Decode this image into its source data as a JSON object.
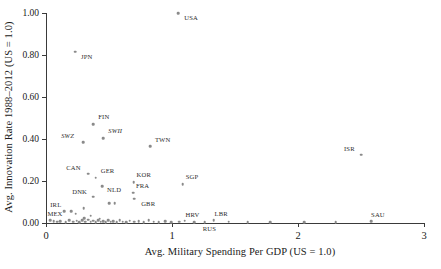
{
  "chart_data": {
    "type": "scatter",
    "title": "",
    "xlabel": "Avg. Military Spending Per GDP (US = 1.0)",
    "ylabel": "Avg. Innovation Rate 1988–2012 (US = 1.0)",
    "xlim": [
      0,
      3
    ],
    "ylim": [
      0.0,
      1.0
    ],
    "xticks": [
      "0",
      "1",
      "2",
      "3"
    ],
    "xtick_values": [
      0,
      1,
      2,
      3
    ],
    "yticks": [
      "0.00",
      "0.20",
      "0.40",
      "0.60",
      "0.80",
      "1.00"
    ],
    "ytick_values": [
      0.0,
      0.2,
      0.4,
      0.6,
      0.8,
      1.0
    ],
    "grid": false,
    "legend": null,
    "marker_color": "#8a8a8a",
    "axis_color": "#3a3a3a",
    "labeled_points": [
      {
        "label": "USA",
        "x": 1.05,
        "y": 1.0,
        "lx": 6,
        "ly": 5,
        "italic": false
      },
      {
        "label": "JPN",
        "x": 0.23,
        "y": 0.815,
        "lx": 6,
        "ly": 5,
        "italic": false
      },
      {
        "label": "FIN",
        "x": 0.375,
        "y": 0.47,
        "lx": 5,
        "ly": -7,
        "italic": false
      },
      {
        "label": "SWII",
        "x": 0.455,
        "y": 0.405,
        "lx": 5,
        "ly": -7,
        "italic": true
      },
      {
        "label": "SWZ",
        "x": 0.295,
        "y": 0.385,
        "lx": -22,
        "ly": -6,
        "italic": true
      },
      {
        "label": "TWN",
        "x": 0.825,
        "y": 0.365,
        "lx": 5,
        "ly": -6,
        "italic": false
      },
      {
        "label": "ISR",
        "x": 2.5,
        "y": 0.325,
        "lx": -17,
        "ly": -6,
        "italic": false
      },
      {
        "label": "CAN",
        "x": 0.335,
        "y": 0.235,
        "lx": -22,
        "ly": -6,
        "italic": false
      },
      {
        "label": "GER",
        "x": 0.395,
        "y": 0.215,
        "lx": 5,
        "ly": -7,
        "italic": false
      },
      {
        "label": "KOR",
        "x": 0.695,
        "y": 0.195,
        "lx": 3,
        "ly": -7,
        "italic": false
      },
      {
        "label": "SGP",
        "x": 1.085,
        "y": 0.185,
        "lx": 3,
        "ly": -7,
        "italic": false
      },
      {
        "label": "NLD",
        "x": 0.445,
        "y": 0.175,
        "lx": 5,
        "ly": 4,
        "italic": false
      },
      {
        "label": "FRA",
        "x": 0.69,
        "y": 0.145,
        "lx": 3,
        "ly": -7,
        "italic": false
      },
      {
        "label": "DNK",
        "x": 0.375,
        "y": 0.125,
        "lx": -21,
        "ly": -5,
        "italic": false
      },
      {
        "label": "GBR",
        "x": 0.7,
        "y": 0.115,
        "lx": 7,
        "ly": 5,
        "italic": false
      },
      {
        "label": "IRL",
        "x": 0.145,
        "y": 0.055,
        "lx": -14,
        "ly": -6,
        "italic": false
      },
      {
        "label": "MEX",
        "x": 0.035,
        "y": 0.012,
        "lx": -3,
        "ly": -6,
        "italic": false
      },
      {
        "label": "HRV",
        "x": 1.1,
        "y": 0.01,
        "lx": 1,
        "ly": -6,
        "italic": false
      },
      {
        "label": "RUS",
        "x": 1.26,
        "y": 0.005,
        "lx": -2,
        "ly": 7,
        "italic": false
      },
      {
        "label": "LBR",
        "x": 1.33,
        "y": 0.012,
        "lx": 1,
        "ly": -6,
        "italic": false
      },
      {
        "label": "SAU",
        "x": 2.58,
        "y": 0.008,
        "lx": 0,
        "ly": -6,
        "italic": false
      }
    ],
    "unlabeled_points": [
      {
        "x": 0.2,
        "y": 0.055
      },
      {
        "x": 0.235,
        "y": 0.045
      },
      {
        "x": 0.3,
        "y": 0.07
      },
      {
        "x": 0.355,
        "y": 0.035
      },
      {
        "x": 0.425,
        "y": 0.02
      },
      {
        "x": 0.5,
        "y": 0.095
      },
      {
        "x": 0.545,
        "y": 0.095
      },
      {
        "x": 0.305,
        "y": 0.022
      },
      {
        "x": 0.06,
        "y": 0.008
      },
      {
        "x": 0.09,
        "y": 0.006
      },
      {
        "x": 0.115,
        "y": 0.009
      },
      {
        "x": 0.155,
        "y": 0.005
      },
      {
        "x": 0.185,
        "y": 0.012
      },
      {
        "x": 0.215,
        "y": 0.006
      },
      {
        "x": 0.245,
        "y": 0.01
      },
      {
        "x": 0.265,
        "y": 0.004
      },
      {
        "x": 0.285,
        "y": 0.013
      },
      {
        "x": 0.31,
        "y": 0.006
      },
      {
        "x": 0.335,
        "y": 0.016
      },
      {
        "x": 0.355,
        "y": 0.007
      },
      {
        "x": 0.375,
        "y": 0.011
      },
      {
        "x": 0.395,
        "y": 0.005
      },
      {
        "x": 0.415,
        "y": 0.014
      },
      {
        "x": 0.435,
        "y": 0.006
      },
      {
        "x": 0.455,
        "y": 0.009
      },
      {
        "x": 0.475,
        "y": 0.004
      },
      {
        "x": 0.495,
        "y": 0.012
      },
      {
        "x": 0.515,
        "y": 0.006
      },
      {
        "x": 0.535,
        "y": 0.008
      },
      {
        "x": 0.56,
        "y": 0.005
      },
      {
        "x": 0.585,
        "y": 0.013
      },
      {
        "x": 0.61,
        "y": 0.006
      },
      {
        "x": 0.635,
        "y": 0.004
      },
      {
        "x": 0.665,
        "y": 0.01
      },
      {
        "x": 0.7,
        "y": 0.006
      },
      {
        "x": 0.735,
        "y": 0.008
      },
      {
        "x": 0.775,
        "y": 0.005
      },
      {
        "x": 0.815,
        "y": 0.012
      },
      {
        "x": 0.855,
        "y": 0.006
      },
      {
        "x": 0.895,
        "y": 0.004
      },
      {
        "x": 0.945,
        "y": 0.009
      },
      {
        "x": 0.995,
        "y": 0.005
      },
      {
        "x": 1.055,
        "y": 0.007
      },
      {
        "x": 1.175,
        "y": 0.004
      },
      {
        "x": 1.45,
        "y": 0.006
      },
      {
        "x": 1.6,
        "y": 0.003
      },
      {
        "x": 1.78,
        "y": 0.005
      },
      {
        "x": 2.05,
        "y": 0.004
      },
      {
        "x": 2.3,
        "y": 0.003
      }
    ]
  }
}
